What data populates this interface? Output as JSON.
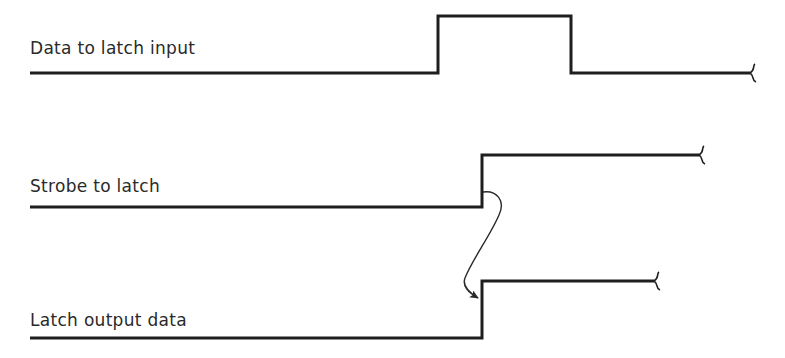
{
  "diagram": {
    "type": "timing-diagram",
    "colors": {
      "line": "#1e1e1e",
      "text": "#2a2a2a",
      "background": "#ffffff"
    },
    "signals": [
      {
        "label": "Data to latch input",
        "waveform": "low-high-low",
        "transitions": [
          "rise",
          "fall"
        ],
        "continues": true
      },
      {
        "label": "Strobe to latch",
        "waveform": "low-high",
        "transitions": [
          "rise"
        ],
        "continues": true
      },
      {
        "label": "Latch output data",
        "waveform": "low-high",
        "transitions": [
          "rise"
        ],
        "continues": true
      }
    ],
    "causality_arrow": {
      "from": "Strobe to latch rising edge",
      "to": "Latch output data rising edge"
    }
  }
}
